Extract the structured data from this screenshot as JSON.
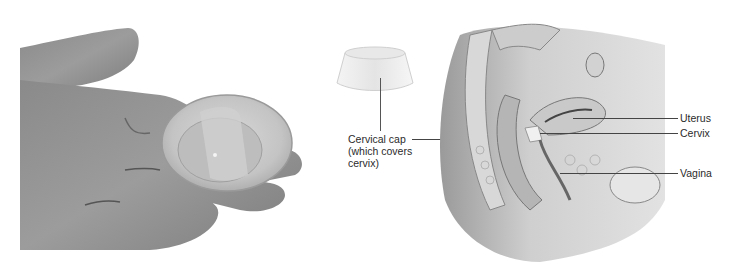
{
  "figure": {
    "left_photo": {
      "description": "Hand holding a clear silicone cervical cap"
    },
    "cap_illustration": {
      "label_lines": [
        "Cervical cap",
        "(which covers",
        "cervix)"
      ]
    },
    "anatomy_illustration": {
      "description": "Sagittal cross-section of female pelvis",
      "labels": [
        {
          "text": "Uterus"
        },
        {
          "text": "Cervix"
        },
        {
          "text": "Vagina"
        }
      ]
    }
  }
}
